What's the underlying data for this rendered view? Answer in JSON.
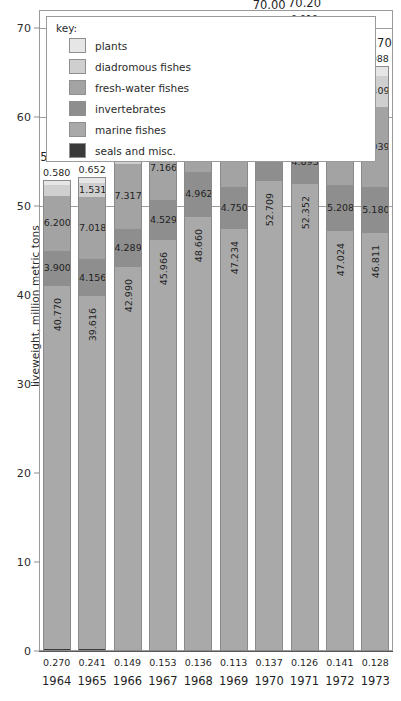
{
  "chart_data": {
    "type": "bar",
    "subtype": "stacked-vertical",
    "title": "",
    "xlabel": "",
    "ylabel": "liveweight, million metric tons",
    "ylim": [
      0,
      72
    ],
    "yticks": [
      0,
      10,
      20,
      30,
      40,
      50,
      60,
      70
    ],
    "ytick_labels": [
      "0",
      "10",
      "20",
      "30",
      "40",
      "50",
      "60",
      "70"
    ],
    "grid": true,
    "legend_position": "top-left-inside",
    "legend_title": "key:",
    "categories": [
      "1964",
      "1965",
      "1966",
      "1967",
      "1968",
      "1969",
      "1970",
      "1971",
      "1972",
      "1973"
    ],
    "series": [
      {
        "name": "seals and misc.",
        "color": "#3a3a3a",
        "label_position": "below-axis",
        "values": [
          0.27,
          0.241,
          0.149,
          0.153,
          0.136,
          0.113,
          0.137,
          0.126,
          0.141,
          0.128
        ],
        "value_labels": [
          "0.270",
          "0.241",
          "0.149",
          "0.153",
          "0.136",
          "0.113",
          "0.137",
          "0.126",
          "0.141",
          "0.128"
        ]
      },
      {
        "name": "marine fishes",
        "color": "#a9a9a9",
        "label_position": "inside-vertical",
        "values": [
          40.77,
          39.616,
          42.99,
          45.966,
          48.66,
          47.234,
          52.709,
          52.352,
          47.024,
          46.811
        ],
        "value_labels": [
          "40.770",
          "39.616",
          "42.990",
          "45.966",
          "48.660",
          "47.234",
          "52.709",
          "52.352",
          "47.024",
          "46.811"
        ]
      },
      {
        "name": "invertebrates",
        "color": "#8e8e8e",
        "label_position": "inside",
        "values": [
          3.9,
          4.156,
          4.289,
          4.529,
          4.962,
          4.75,
          4.944,
          4.893,
          5.208,
          5.18
        ],
        "value_labels": [
          "3.900",
          "4.156",
          "4.289",
          "4.529",
          "4.962",
          "4.750",
          "4.944",
          "4.893",
          "5.208",
          "5.180"
        ]
      },
      {
        "name": "fresh-water fishes",
        "color": "#a3a3a3",
        "label_position": "inside",
        "values": [
          6.2,
          7.018,
          7.317,
          7.166,
          7.358,
          7.604,
          8.254,
          8.785,
          8.848,
          9.039
        ],
        "value_labels": [
          "6.200",
          "7.018",
          "7.317",
          "7.166",
          "7.358",
          "7.604",
          "8.254",
          "8.785",
          "8.848",
          "9.039"
        ]
      },
      {
        "name": "diadromous fishes",
        "color": "#cfcfcf",
        "label_position": "inside",
        "values": [
          1.18,
          1.531,
          1.862,
          1.789,
          1.909,
          2.188,
          3.038,
          3.098,
          3.328,
          3.409
        ],
        "value_labels": [
          "1.180",
          "1.531",
          "1.862",
          "1.789",
          "1.909",
          "2.188",
          "3.038",
          "3.098",
          "3.328",
          "3.409"
        ]
      },
      {
        "name": "plants",
        "color": "#e6e6e6",
        "label_position": "above",
        "values": [
          0.58,
          0.652,
          0.685,
          0.827,
          0.848,
          0.765,
          0.875,
          0.919,
          0.889,
          1.088
        ],
        "value_labels": [
          "0.580",
          "0.652",
          "0.685",
          "0.827",
          "0.848",
          "0.765",
          "0.875",
          "0.919",
          "0.889",
          "1.088"
        ]
      }
    ],
    "totals": [
      52.9,
      53.2,
      57.3,
      60.4,
      63.9,
      62.7,
      70.0,
      70.2,
      65.5,
      65.7
    ],
    "total_labels": [
      "52.90",
      "53.20",
      "57.30",
      "60.40",
      "63.90",
      "62.70",
      "70.00",
      "70.20",
      "65.50",
      "65.70"
    ]
  },
  "legend": {
    "title": "key:",
    "items": [
      {
        "label": "plants",
        "color": "#e6e6e6"
      },
      {
        "label": "diadromous fishes",
        "color": "#cfcfcf"
      },
      {
        "label": "fresh-water fishes",
        "color": "#a3a3a3"
      },
      {
        "label": "invertebrates",
        "color": "#8e8e8e"
      },
      {
        "label": "marine fishes",
        "color": "#a9a9a9"
      },
      {
        "label": "seals and misc.",
        "color": "#3a3a3a"
      }
    ]
  },
  "axes": {
    "y_title": "liveweight, million metric tons",
    "y_ticks": [
      "0",
      "10",
      "20",
      "30",
      "40",
      "50",
      "60",
      "70"
    ]
  }
}
